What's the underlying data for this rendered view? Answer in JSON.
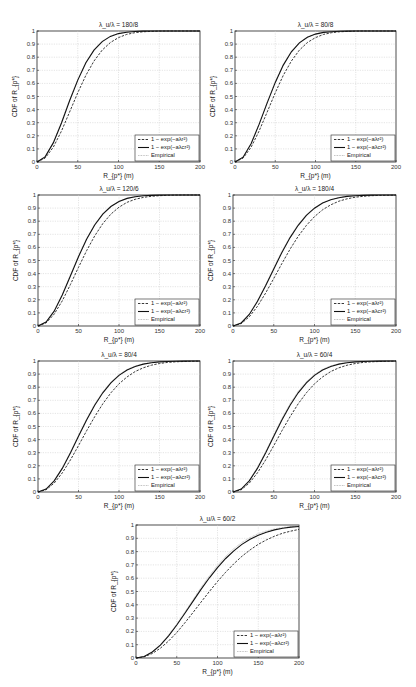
{
  "chart_data": [
    {
      "type": "line",
      "title": "λ_u/λ = 180/8",
      "xlabel": "R_{p*} (m)",
      "ylabel": "CDF of R_{p*}",
      "xlim": [
        0,
        200
      ],
      "ylim": [
        0,
        1
      ],
      "xticks": [
        "0",
        "50",
        "100",
        "150",
        "200"
      ],
      "yticks": [
        "0",
        "0.1",
        "0.2",
        "0.3",
        "0.4",
        "0.5",
        "0.6",
        "0.7",
        "0.8",
        "0.9",
        "1"
      ],
      "grid": true,
      "legend_position": "bottom-right",
      "x": [
        0,
        10,
        20,
        30,
        40,
        50,
        60,
        70,
        80,
        90,
        100,
        110,
        120,
        130,
        140,
        150,
        160,
        170,
        180,
        190,
        200
      ],
      "series": [
        {
          "name": "1 − exp(−aλr²)",
          "style": "dashed",
          "values": [
            0,
            0.03,
            0.113,
            0.237,
            0.382,
            0.529,
            0.662,
            0.771,
            0.854,
            0.912,
            0.95,
            0.974,
            0.987,
            0.994,
            0.997,
            0.999,
            1,
            1,
            1,
            1,
            1
          ]
        },
        {
          "name": "1 − exp(−aλcr²)",
          "style": "solid",
          "values": [
            0,
            0.039,
            0.146,
            0.298,
            0.467,
            0.625,
            0.757,
            0.854,
            0.919,
            0.959,
            0.98,
            0.991,
            0.996,
            0.999,
            1,
            1,
            1,
            1,
            1,
            1,
            1
          ]
        },
        {
          "name": "Empirical",
          "style": "dotted",
          "values": [
            0,
            0.042,
            0.15,
            0.305,
            0.475,
            0.632,
            0.762,
            0.858,
            0.922,
            0.961,
            0.982,
            0.992,
            0.997,
            0.999,
            1,
            1,
            1,
            1,
            1,
            1,
            1
          ]
        }
      ]
    },
    {
      "type": "line",
      "title": "λ_u/λ = 80/8",
      "xlabel": "R_{p*} (m)",
      "ylabel": "CDF of R_{p*}",
      "xlim": [
        0,
        200
      ],
      "ylim": [
        0,
        1
      ],
      "xticks": [
        "0",
        "50",
        "100",
        "150",
        "200"
      ],
      "yticks": [
        "0",
        "0.1",
        "0.2",
        "0.3",
        "0.4",
        "0.5",
        "0.6",
        "0.7",
        "0.8",
        "0.9",
        "1"
      ],
      "grid": true,
      "legend_position": "bottom-right",
      "x": [
        0,
        10,
        20,
        30,
        40,
        50,
        60,
        70,
        80,
        90,
        100,
        110,
        120,
        130,
        140,
        150,
        160,
        170,
        180,
        190,
        200
      ],
      "series": [
        {
          "name": "1 − exp(−aλr²)",
          "style": "dashed",
          "values": [
            0,
            0.03,
            0.113,
            0.237,
            0.382,
            0.529,
            0.662,
            0.771,
            0.854,
            0.912,
            0.95,
            0.974,
            0.987,
            0.994,
            0.997,
            0.999,
            1,
            1,
            1,
            1,
            1
          ]
        },
        {
          "name": "1 − exp(−aλcr²)",
          "style": "solid",
          "values": [
            0,
            0.037,
            0.139,
            0.287,
            0.451,
            0.608,
            0.74,
            0.841,
            0.909,
            0.952,
            0.976,
            0.989,
            0.995,
            0.998,
            0.999,
            1,
            1,
            1,
            1,
            1,
            1
          ]
        },
        {
          "name": "Empirical",
          "style": "dotted",
          "values": [
            0,
            0.04,
            0.143,
            0.293,
            0.458,
            0.615,
            0.746,
            0.846,
            0.913,
            0.955,
            0.978,
            0.99,
            0.996,
            0.998,
            0.999,
            1,
            1,
            1,
            1,
            1,
            1
          ]
        }
      ]
    },
    {
      "type": "line",
      "title": "λ_u/λ = 120/6",
      "xlabel": "R_{p*} (m)",
      "ylabel": "CDF of R_{p*}",
      "xlim": [
        0,
        200
      ],
      "ylim": [
        0,
        1
      ],
      "xticks": [
        "0",
        "50",
        "100",
        "150",
        "200"
      ],
      "yticks": [
        "0",
        "0.1",
        "0.2",
        "0.3",
        "0.4",
        "0.5",
        "0.6",
        "0.7",
        "0.8",
        "0.9",
        "1"
      ],
      "grid": true,
      "legend_position": "bottom-right",
      "x": [
        0,
        10,
        20,
        30,
        40,
        50,
        60,
        70,
        80,
        90,
        100,
        110,
        120,
        130,
        140,
        150,
        160,
        170,
        180,
        190,
        200
      ],
      "series": [
        {
          "name": "1 − exp(−aλr²)",
          "style": "dashed",
          "values": [
            0,
            0.024,
            0.091,
            0.192,
            0.316,
            0.448,
            0.575,
            0.688,
            0.782,
            0.854,
            0.907,
            0.944,
            0.967,
            0.982,
            0.99,
            0.995,
            0.998,
            0.999,
            1,
            1,
            1
          ]
        },
        {
          "name": "1 − exp(−aλcr²)",
          "style": "solid",
          "values": [
            0,
            0.03,
            0.113,
            0.237,
            0.382,
            0.529,
            0.662,
            0.771,
            0.854,
            0.912,
            0.95,
            0.974,
            0.987,
            0.994,
            0.997,
            0.999,
            1,
            1,
            1,
            1,
            1
          ]
        },
        {
          "name": "Empirical",
          "style": "dotted",
          "values": [
            0,
            0.032,
            0.117,
            0.243,
            0.389,
            0.536,
            0.668,
            0.776,
            0.858,
            0.915,
            0.952,
            0.975,
            0.988,
            0.995,
            0.998,
            0.999,
            1,
            1,
            1,
            1,
            1
          ]
        }
      ]
    },
    {
      "type": "line",
      "title": "λ_u/λ = 180/4",
      "xlabel": "R_{p*} (m)",
      "ylabel": "CDF of R_{p*}",
      "xlim": [
        0,
        200
      ],
      "ylim": [
        0,
        1
      ],
      "xticks": [
        "0",
        "50",
        "100",
        "150",
        "200"
      ],
      "yticks": [
        "0",
        "0.1",
        "0.2",
        "0.3",
        "0.4",
        "0.5",
        "0.6",
        "0.7",
        "0.8",
        "0.9",
        "1"
      ],
      "grid": true,
      "legend_position": "bottom-right",
      "x": [
        0,
        10,
        20,
        30,
        40,
        50,
        60,
        70,
        80,
        90,
        100,
        110,
        120,
        130,
        140,
        150,
        160,
        170,
        180,
        190,
        200
      ],
      "series": [
        {
          "name": "1 − exp(−aλr²)",
          "style": "dashed",
          "values": [
            0,
            0.018,
            0.07,
            0.15,
            0.251,
            0.363,
            0.477,
            0.587,
            0.685,
            0.768,
            0.835,
            0.887,
            0.925,
            0.953,
            0.971,
            0.983,
            0.99,
            0.995,
            0.997,
            0.998,
            0.999
          ]
        },
        {
          "name": "1 − exp(−aλcr²)",
          "style": "solid",
          "values": [
            0,
            0.023,
            0.088,
            0.186,
            0.307,
            0.436,
            0.562,
            0.675,
            0.769,
            0.844,
            0.899,
            0.938,
            0.963,
            0.979,
            0.989,
            0.994,
            0.997,
            0.999,
            1,
            1,
            1
          ]
        },
        {
          "name": "Empirical",
          "style": "dotted",
          "values": [
            0,
            0.025,
            0.092,
            0.192,
            0.314,
            0.444,
            0.57,
            0.682,
            0.776,
            0.85,
            0.903,
            0.941,
            0.966,
            0.981,
            0.99,
            0.995,
            0.998,
            0.999,
            1,
            1,
            1
          ]
        }
      ]
    },
    {
      "type": "line",
      "title": "λ_u/λ = 80/4",
      "xlabel": "R_{p*} (m)",
      "ylabel": "CDF of R_{p*}",
      "xlim": [
        0,
        200
      ],
      "ylim": [
        0,
        1
      ],
      "xticks": [
        "0",
        "50",
        "100",
        "150",
        "200"
      ],
      "yticks": [
        "0",
        "0.1",
        "0.2",
        "0.3",
        "0.4",
        "0.5",
        "0.6",
        "0.7",
        "0.8",
        "0.9",
        "1"
      ],
      "grid": true,
      "legend_position": "bottom-right",
      "x": [
        0,
        10,
        20,
        30,
        40,
        50,
        60,
        70,
        80,
        90,
        100,
        110,
        120,
        130,
        140,
        150,
        160,
        170,
        180,
        190,
        200
      ],
      "series": [
        {
          "name": "1 − exp(−aλr²)",
          "style": "dashed",
          "values": [
            0,
            0.017,
            0.068,
            0.146,
            0.244,
            0.354,
            0.467,
            0.575,
            0.673,
            0.757,
            0.826,
            0.879,
            0.92,
            0.948,
            0.968,
            0.981,
            0.989,
            0.994,
            0.996,
            0.998,
            0.999
          ]
        },
        {
          "name": "1 − exp(−aλcr²)",
          "style": "solid",
          "values": [
            0,
            0.022,
            0.085,
            0.18,
            0.298,
            0.425,
            0.549,
            0.662,
            0.757,
            0.833,
            0.89,
            0.931,
            0.959,
            0.976,
            0.987,
            0.993,
            0.996,
            0.998,
            0.999,
            1,
            1
          ]
        },
        {
          "name": "Empirical",
          "style": "dotted",
          "values": [
            0,
            0.024,
            0.089,
            0.186,
            0.305,
            0.433,
            0.557,
            0.67,
            0.765,
            0.84,
            0.896,
            0.935,
            0.962,
            0.978,
            0.988,
            0.994,
            0.997,
            0.999,
            1,
            1,
            1
          ]
        }
      ]
    },
    {
      "type": "line",
      "title": "λ_u/λ = 60/4",
      "xlabel": "R_{p*} (m)",
      "ylabel": "CDF of R_{p*}",
      "xlim": [
        0,
        200
      ],
      "ylim": [
        0,
        1
      ],
      "xticks": [
        "0",
        "50",
        "100",
        "150",
        "200"
      ],
      "yticks": [
        "0",
        "0.1",
        "0.2",
        "0.3",
        "0.4",
        "0.5",
        "0.6",
        "0.7",
        "0.8",
        "0.9",
        "1"
      ],
      "grid": true,
      "legend_position": "bottom-right",
      "x": [
        0,
        10,
        20,
        30,
        40,
        50,
        60,
        70,
        80,
        90,
        100,
        110,
        120,
        130,
        140,
        150,
        160,
        170,
        180,
        190,
        200
      ],
      "series": [
        {
          "name": "1 − exp(−aλr²)",
          "style": "dashed",
          "values": [
            0,
            0.017,
            0.068,
            0.146,
            0.244,
            0.354,
            0.467,
            0.575,
            0.673,
            0.757,
            0.826,
            0.879,
            0.92,
            0.948,
            0.968,
            0.981,
            0.989,
            0.994,
            0.996,
            0.998,
            0.999
          ]
        },
        {
          "name": "1 − exp(−aλcr²)",
          "style": "solid",
          "values": [
            0,
            0.022,
            0.085,
            0.18,
            0.298,
            0.425,
            0.549,
            0.662,
            0.757,
            0.833,
            0.89,
            0.931,
            0.959,
            0.976,
            0.987,
            0.993,
            0.996,
            0.998,
            0.999,
            1,
            1
          ]
        },
        {
          "name": "Empirical",
          "style": "dotted",
          "values": [
            0,
            0.024,
            0.09,
            0.188,
            0.308,
            0.437,
            0.562,
            0.674,
            0.769,
            0.843,
            0.898,
            0.937,
            0.963,
            0.979,
            0.989,
            0.995,
            0.998,
            0.999,
            1,
            1,
            1
          ]
        }
      ]
    },
    {
      "type": "line",
      "title": "λ_u/λ = 60/2",
      "xlabel": "R_{p*} (m)",
      "ylabel": "CDF of R_{p*}",
      "xlim": [
        0,
        200
      ],
      "ylim": [
        0,
        1
      ],
      "xticks": [
        "0",
        "50",
        "100",
        "150",
        "200"
      ],
      "yticks": [
        "0",
        "0.1",
        "0.2",
        "0.3",
        "0.4",
        "0.5",
        "0.6",
        "0.7",
        "0.8",
        "0.9",
        "1"
      ],
      "grid": true,
      "legend_position": "bottom-right",
      "x": [
        0,
        10,
        20,
        30,
        40,
        50,
        60,
        70,
        80,
        90,
        100,
        110,
        120,
        130,
        140,
        150,
        160,
        170,
        180,
        190,
        200
      ],
      "series": [
        {
          "name": "1 − exp(−aλr²)",
          "style": "dashed",
          "values": [
            0,
            0.009,
            0.034,
            0.074,
            0.128,
            0.192,
            0.265,
            0.343,
            0.422,
            0.5,
            0.575,
            0.645,
            0.708,
            0.765,
            0.813,
            0.855,
            0.888,
            0.916,
            0.938,
            0.954,
            0.967
          ]
        },
        {
          "name": "1 − exp(−aλcr²)",
          "style": "solid",
          "values": [
            0,
            0.011,
            0.045,
            0.097,
            0.167,
            0.248,
            0.336,
            0.428,
            0.518,
            0.603,
            0.68,
            0.748,
            0.806,
            0.854,
            0.893,
            0.923,
            0.946,
            0.963,
            0.975,
            0.984,
            0.989
          ]
        },
        {
          "name": "Empirical",
          "style": "dotted",
          "values": [
            0,
            0.012,
            0.047,
            0.101,
            0.173,
            0.256,
            0.346,
            0.44,
            0.532,
            0.618,
            0.696,
            0.764,
            0.822,
            0.869,
            0.906,
            0.935,
            0.956,
            0.971,
            0.981,
            0.988,
            0.993
          ]
        }
      ]
    }
  ]
}
